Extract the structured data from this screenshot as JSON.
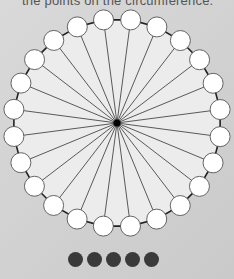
{
  "caption": "the points on the circumference.",
  "diagram": {
    "type": "star-graph",
    "center": {
      "x": 117,
      "y": 123
    },
    "radius": 104,
    "node_count": 24,
    "node_radius": 10,
    "colors": {
      "disc_fill": "#ececec",
      "outline": "#222222",
      "spokes": "#333333",
      "node_fill": "#ffffff",
      "node_stroke": "#555555",
      "hub": "#000000"
    }
  },
  "pager": {
    "dot_count": 5,
    "dot_color": "#3a3a3a"
  }
}
